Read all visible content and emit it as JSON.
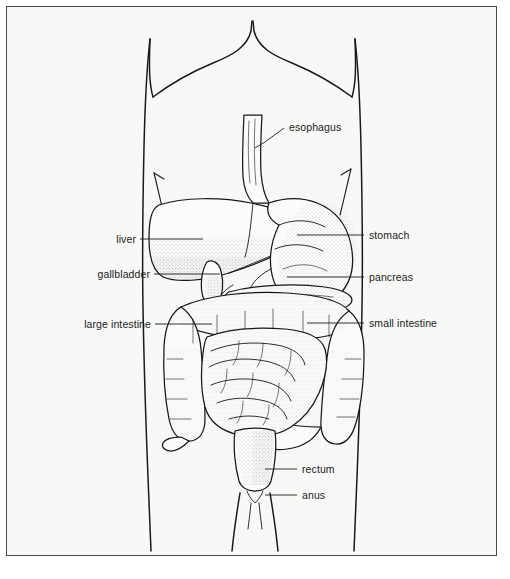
{
  "figure": {
    "background_color": "#f8f8f6",
    "frame_color": "#4a4a4a",
    "ink_color": "#1a1a1a",
    "style": "line drawing with stipple shading"
  },
  "labels": [
    {
      "id": "esophagus",
      "text": "esophagus",
      "side": "right",
      "text_x": 282,
      "text_y": 124,
      "leader_type": "diagonal",
      "leader": "M 277 121 L 258 135 L 248 141"
    },
    {
      "id": "stomach",
      "text": "stomach",
      "side": "right",
      "text_x": 362,
      "text_y": 232,
      "leader_type": "horizontal",
      "leader": "M 357 228 L 290 228"
    },
    {
      "id": "pancreas",
      "text": "pancreas",
      "side": "right",
      "text_x": 362,
      "text_y": 274,
      "leader_type": "horizontal",
      "leader": "M 357 270 L 280 270"
    },
    {
      "id": "small-intestine",
      "text": "small intestine",
      "side": "right",
      "text_x": 362,
      "text_y": 320,
      "leader_type": "horizontal",
      "leader": "M 357 316 L 300 316"
    },
    {
      "id": "liver",
      "text": "liver",
      "side": "left",
      "text_x": 110,
      "text_y": 236,
      "leader_type": "horizontal",
      "leader": "M 133 232 L 196 232"
    },
    {
      "id": "gallbladder",
      "text": "gallbladder",
      "side": "left",
      "text_x": 84,
      "text_y": 271,
      "leader_type": "horizontal",
      "leader": "M 147 267 L 213 267"
    },
    {
      "id": "large-intestine",
      "text": "large intestine",
      "side": "left",
      "text_x": 62,
      "text_y": 321,
      "leader_type": "horizontal",
      "leader": "M 148 317 L 205 317"
    },
    {
      "id": "rectum",
      "text": "rectum",
      "side": "right",
      "text_x": 295,
      "text_y": 466,
      "leader_type": "horizontal",
      "leader": "M 290 462 L 258 462"
    },
    {
      "id": "anus",
      "text": "anus",
      "side": "right",
      "text_x": 295,
      "text_y": 492,
      "leader_type": "horizontal",
      "leader": "M 290 488 L 258 488"
    }
  ],
  "organs": [
    "esophagus",
    "stomach",
    "liver",
    "gallbladder",
    "pancreas",
    "small intestine",
    "large intestine",
    "rectum",
    "anus"
  ]
}
